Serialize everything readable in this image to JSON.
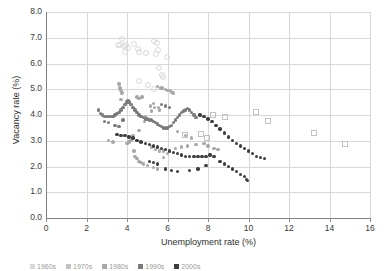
{
  "chart_data": {
    "type": "scatter",
    "title": "",
    "xlabel": "Unemployment rate (%)",
    "ylabel": "Vacancy rate (%)",
    "xlim": [
      0,
      16
    ],
    "ylim": [
      0,
      8
    ],
    "xticks": [
      "0",
      "2",
      "4",
      "6",
      "8",
      "10",
      "12",
      "14",
      "16"
    ],
    "yticks": [
      "0.0",
      "1.0",
      "2.0",
      "3.0",
      "4.0",
      "5.0",
      "6.0",
      "7.0",
      "8.0"
    ],
    "grid": true,
    "legend_position": "bottom",
    "series": [
      {
        "name": "1960s",
        "color": "#d9d9d9",
        "marker": "open-circle",
        "points": [
          [
            3.7,
            7.0
          ],
          [
            3.5,
            6.75
          ],
          [
            3.6,
            6.75
          ],
          [
            3.9,
            6.75
          ],
          [
            3.8,
            6.7
          ],
          [
            4.0,
            6.65
          ],
          [
            3.85,
            6.5
          ],
          [
            4.3,
            6.8
          ],
          [
            4.5,
            6.6
          ],
          [
            4.55,
            6.5
          ],
          [
            4.9,
            6.45
          ],
          [
            5.3,
            6.9
          ],
          [
            5.45,
            6.85
          ],
          [
            5.5,
            6.55
          ],
          [
            5.4,
            6.4
          ],
          [
            5.95,
            6.3
          ],
          [
            5.55,
            5.85
          ],
          [
            5.7,
            5.6
          ],
          [
            5.75,
            5.5
          ],
          [
            5.3,
            5.05
          ],
          [
            5.0,
            5.2
          ],
          [
            4.55,
            5.35
          ]
        ]
      },
      {
        "name": "1970s",
        "color": "#c2c2c2",
        "marker": "open-square",
        "points": [
          [
            8.2,
            4.05
          ],
          [
            8.8,
            3.95
          ],
          [
            10.3,
            4.15
          ],
          [
            10.9,
            3.8
          ],
          [
            13.2,
            3.35
          ],
          [
            14.7,
            2.9
          ],
          [
            7.6,
            3.3
          ],
          [
            7.9,
            3.15
          ],
          [
            6.8,
            3.25
          ]
        ]
      },
      {
        "name": "1980s",
        "color": "#a8a8a8",
        "marker": "filled-circle",
        "points": [
          [
            3.6,
            5.2
          ],
          [
            3.65,
            5.05
          ],
          [
            3.7,
            4.95
          ],
          [
            3.75,
            4.85
          ],
          [
            3.7,
            4.6
          ],
          [
            4.5,
            4.7
          ],
          [
            4.6,
            4.65
          ],
          [
            4.75,
            4.7
          ],
          [
            5.3,
            4.45
          ],
          [
            5.35,
            4.3
          ],
          [
            5.5,
            5.1
          ],
          [
            5.65,
            5.05
          ],
          [
            5.75,
            5.05
          ],
          [
            5.9,
            5.0
          ],
          [
            6.0,
            4.95
          ],
          [
            6.1,
            4.95
          ],
          [
            6.2,
            4.9
          ],
          [
            6.3,
            4.85
          ],
          [
            5.55,
            4.3
          ],
          [
            5.6,
            4.2
          ],
          [
            5.15,
            4.35
          ],
          [
            5.2,
            4.15
          ],
          [
            4.9,
            3.95
          ],
          [
            4.85,
            3.75
          ],
          [
            4.6,
            3.4
          ],
          [
            4.3,
            3.2
          ],
          [
            4.2,
            3.0
          ],
          [
            4.1,
            2.95
          ],
          [
            4.0,
            2.9
          ],
          [
            4.35,
            2.6
          ],
          [
            4.4,
            2.4
          ],
          [
            4.5,
            2.3
          ],
          [
            4.6,
            2.2
          ],
          [
            4.7,
            2.15
          ],
          [
            4.8,
            2.1
          ],
          [
            5.0,
            2.05
          ],
          [
            5.3,
            1.95
          ],
          [
            5.5,
            1.9
          ],
          [
            5.8,
            2.35
          ],
          [
            6.0,
            2.5
          ],
          [
            6.4,
            2.7
          ],
          [
            6.7,
            2.75
          ],
          [
            7.0,
            2.8
          ],
          [
            7.4,
            2.85
          ],
          [
            7.8,
            2.9
          ],
          [
            8.0,
            2.8
          ],
          [
            8.3,
            2.7
          ],
          [
            8.5,
            2.65
          ],
          [
            3.1,
            3.0
          ],
          [
            3.3,
            2.95
          ],
          [
            5.2,
            2.75
          ],
          [
            5.4,
            2.65
          ],
          [
            5.6,
            2.6
          ],
          [
            5.8,
            2.6
          ],
          [
            6.5,
            3.35
          ],
          [
            6.9,
            3.2
          ],
          [
            7.2,
            3.1
          ]
        ]
      },
      {
        "name": "1990s",
        "color": "#7a7a7a",
        "marker": "filled-circle",
        "points": [
          [
            2.6,
            4.2
          ],
          [
            2.7,
            4.05
          ],
          [
            2.8,
            4.0
          ],
          [
            2.9,
            3.95
          ],
          [
            3.0,
            3.95
          ],
          [
            3.1,
            3.95
          ],
          [
            3.2,
            3.95
          ],
          [
            3.3,
            3.95
          ],
          [
            3.4,
            4.0
          ],
          [
            3.5,
            4.05
          ],
          [
            3.6,
            4.1
          ],
          [
            3.7,
            4.2
          ],
          [
            3.8,
            4.3
          ],
          [
            3.9,
            4.4
          ],
          [
            4.0,
            4.5
          ],
          [
            4.05,
            4.55
          ],
          [
            4.1,
            4.5
          ],
          [
            4.2,
            4.4
          ],
          [
            4.3,
            4.3
          ],
          [
            4.4,
            4.2
          ],
          [
            4.5,
            4.1
          ],
          [
            4.6,
            4.0
          ],
          [
            4.7,
            3.95
          ],
          [
            4.8,
            3.9
          ],
          [
            4.9,
            3.85
          ],
          [
            5.0,
            3.85
          ],
          [
            5.1,
            3.8
          ],
          [
            5.2,
            3.8
          ],
          [
            5.3,
            3.75
          ],
          [
            5.4,
            3.7
          ],
          [
            5.5,
            3.65
          ],
          [
            5.6,
            3.6
          ],
          [
            5.7,
            3.55
          ],
          [
            5.8,
            3.5
          ],
          [
            5.9,
            3.5
          ],
          [
            6.0,
            3.5
          ],
          [
            6.1,
            3.55
          ],
          [
            6.2,
            3.6
          ],
          [
            6.3,
            3.7
          ],
          [
            6.4,
            3.8
          ],
          [
            6.5,
            3.9
          ],
          [
            6.6,
            4.0
          ],
          [
            6.7,
            4.1
          ],
          [
            6.8,
            4.15
          ],
          [
            6.9,
            4.2
          ],
          [
            7.0,
            4.25
          ],
          [
            7.1,
            4.2
          ],
          [
            7.2,
            4.1
          ],
          [
            7.3,
            4.0
          ],
          [
            7.4,
            3.9
          ],
          [
            5.7,
            4.4
          ],
          [
            5.9,
            4.35
          ],
          [
            6.1,
            4.3
          ],
          [
            2.9,
            3.75
          ],
          [
            3.1,
            3.7
          ],
          [
            3.4,
            3.6
          ],
          [
            3.6,
            3.55
          ],
          [
            3.8,
            3.8
          ]
        ]
      },
      {
        "name": "2000s",
        "color": "#3d3d3d",
        "marker": "filled-circle",
        "points": [
          [
            3.5,
            3.25
          ],
          [
            3.7,
            3.2
          ],
          [
            3.9,
            3.2
          ],
          [
            4.1,
            3.15
          ],
          [
            4.3,
            3.1
          ],
          [
            4.5,
            3.0
          ],
          [
            4.7,
            2.95
          ],
          [
            4.9,
            2.9
          ],
          [
            5.1,
            2.85
          ],
          [
            5.3,
            2.8
          ],
          [
            5.5,
            2.75
          ],
          [
            5.7,
            2.7
          ],
          [
            5.9,
            2.65
          ],
          [
            6.1,
            2.6
          ],
          [
            6.3,
            2.55
          ],
          [
            6.5,
            2.5
          ],
          [
            6.7,
            2.45
          ],
          [
            6.9,
            2.4
          ],
          [
            7.1,
            2.4
          ],
          [
            7.3,
            2.4
          ],
          [
            7.5,
            2.4
          ],
          [
            7.7,
            2.4
          ],
          [
            7.9,
            2.4
          ],
          [
            8.1,
            2.45
          ],
          [
            8.3,
            2.4
          ],
          [
            7.6,
            4.0
          ],
          [
            7.8,
            3.95
          ],
          [
            8.0,
            3.85
          ],
          [
            8.2,
            3.75
          ],
          [
            8.4,
            3.6
          ],
          [
            8.6,
            3.45
          ],
          [
            8.8,
            3.3
          ],
          [
            9.0,
            3.15
          ],
          [
            9.2,
            3.0
          ],
          [
            9.4,
            2.9
          ],
          [
            9.6,
            2.8
          ],
          [
            9.8,
            2.7
          ],
          [
            10.0,
            2.6
          ],
          [
            10.2,
            2.5
          ],
          [
            10.4,
            2.4
          ],
          [
            10.6,
            2.35
          ],
          [
            10.8,
            2.3
          ],
          [
            8.6,
            2.2
          ],
          [
            8.8,
            2.1
          ],
          [
            9.0,
            2.0
          ],
          [
            9.2,
            1.9
          ],
          [
            9.4,
            1.8
          ],
          [
            9.6,
            1.7
          ],
          [
            9.8,
            1.6
          ],
          [
            9.9,
            1.5
          ],
          [
            9.95,
            1.45
          ],
          [
            5.9,
            1.9
          ],
          [
            6.2,
            1.85
          ],
          [
            6.5,
            1.8
          ],
          [
            7.1,
            1.85
          ],
          [
            7.5,
            1.9
          ],
          [
            7.9,
            2.05
          ],
          [
            5.1,
            2.2
          ],
          [
            5.3,
            2.15
          ],
          [
            5.5,
            2.1
          ]
        ]
      }
    ],
    "legend_labels": [
      "1960s",
      "1970s",
      "1980s",
      "1990s",
      "2000s"
    ]
  }
}
